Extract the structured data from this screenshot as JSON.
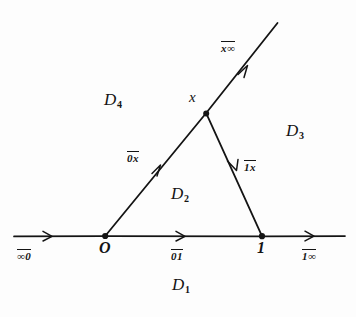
{
  "figure": {
    "type": "geodesic-domain-diagram",
    "background_color": "#fdfdfd",
    "ink_color": "#141414"
  },
  "points": {
    "origin_label": "O",
    "one_label": "1",
    "x_label": "\u0001d4cd"
  },
  "vertices": [
    {
      "name": "origin",
      "label": "O",
      "x": 105,
      "y": 236
    },
    {
      "name": "one",
      "label": "1",
      "x": 262,
      "y": 236
    },
    {
      "name": "x",
      "label": "x",
      "x": 206,
      "y": 113
    }
  ],
  "segments": [
    {
      "name": "infinity-to-origin",
      "label": "∞0",
      "overline": true,
      "arrow": "right"
    },
    {
      "name": "origin-to-one",
      "label": "01",
      "overline": true,
      "arrow": "right"
    },
    {
      "name": "one-to-infinity",
      "label": "1∞",
      "overline": true,
      "arrow": "right"
    },
    {
      "name": "origin-to-x",
      "label": "0x",
      "overline": true,
      "arrow": "up-right"
    },
    {
      "name": "x-to-infinity",
      "label": "x∞",
      "overline": true,
      "arrow": "up-right"
    },
    {
      "name": "one-to-x",
      "label": "1x",
      "overline": true,
      "arrow": "down-left"
    }
  ],
  "segment_labels": {
    "infinity_origin": {
      "text": "∞0",
      "x": 18,
      "y": 252
    },
    "origin_one": {
      "text": "01",
      "x": 172,
      "y": 252
    },
    "one_infinity": {
      "text": "1∞",
      "x": 303,
      "y": 252
    },
    "origin_x": {
      "text": "0x",
      "x": 128,
      "y": 154
    },
    "x_infinity": {
      "text": "x∞",
      "x": 222,
      "y": 44
    },
    "one_x": {
      "text": "1x",
      "x": 245,
      "y": 163
    }
  },
  "regions": [
    {
      "name": "D1",
      "letter": "D",
      "subscript": "1",
      "x": 178,
      "y": 283
    },
    {
      "name": "D2",
      "letter": "D",
      "subscript": "2",
      "x": 177,
      "y": 192
    },
    {
      "name": "D3",
      "letter": "D",
      "subscript": "3",
      "x": 291,
      "y": 129
    },
    {
      "name": "D4",
      "letter": "D",
      "subscript": "4",
      "x": 109,
      "y": 98
    }
  ],
  "point_labels": {
    "origin": {
      "text": "O",
      "x": 101,
      "y": 243
    },
    "one": {
      "text": "1",
      "x": 258,
      "y": 243
    },
    "x": {
      "text": "x",
      "x": 189,
      "y": 94
    }
  }
}
